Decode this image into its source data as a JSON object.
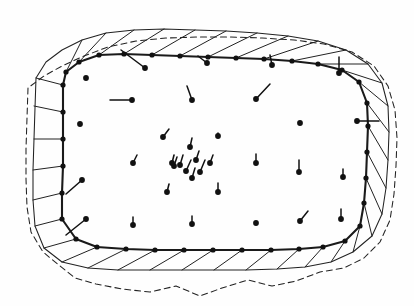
{
  "figure": {
    "kind": "mesh-vector-field",
    "background_color": "#fefefe",
    "ink_color": "#111111",
    "width": 414,
    "height": 306
  },
  "legend": {
    "mesh_boundary_label": "mesh boundary",
    "outer_contour_label": "outer contour",
    "dashed_contour_label": "reference contour",
    "vector_label": "displacement vector"
  },
  "chart_data": {
    "type": "scatter",
    "xlabel": "",
    "ylabel": "",
    "xlim": [
      0,
      414
    ],
    "ylim": [
      0,
      306
    ],
    "grid": false,
    "legend_position": "none",
    "mesh_boundary": [
      [
        63,
        85
      ],
      [
        63,
        112
      ],
      [
        63,
        139
      ],
      [
        63,
        166
      ],
      [
        62,
        193
      ],
      [
        62,
        219
      ],
      [
        76,
        239
      ],
      [
        97,
        247
      ],
      [
        126,
        249
      ],
      [
        155,
        250
      ],
      [
        184,
        250
      ],
      [
        213,
        250
      ],
      [
        242,
        250
      ],
      [
        271,
        250
      ],
      [
        299,
        249
      ],
      [
        323,
        247
      ],
      [
        345,
        241
      ],
      [
        360,
        226
      ],
      [
        364,
        203
      ],
      [
        366,
        178
      ],
      [
        367,
        152
      ],
      [
        368,
        126
      ],
      [
        367,
        103
      ],
      [
        359,
        82
      ],
      [
        342,
        70
      ],
      [
        318,
        64
      ],
      [
        292,
        61
      ],
      [
        264,
        59
      ],
      [
        236,
        58
      ],
      [
        208,
        57
      ],
      [
        180,
        56
      ],
      [
        152,
        55
      ],
      [
        124,
        54
      ],
      [
        99,
        55
      ],
      [
        79,
        62
      ],
      [
        66,
        72
      ]
    ],
    "outer_contour": [
      [
        36,
        78
      ],
      [
        35,
        108
      ],
      [
        34,
        139
      ],
      [
        33,
        170
      ],
      [
        33,
        200
      ],
      [
        35,
        226
      ],
      [
        44,
        248
      ],
      [
        62,
        262
      ],
      [
        88,
        268
      ],
      [
        118,
        270
      ],
      [
        150,
        270
      ],
      [
        182,
        270
      ],
      [
        214,
        270
      ],
      [
        246,
        270
      ],
      [
        277,
        269
      ],
      [
        305,
        267
      ],
      [
        331,
        262
      ],
      [
        353,
        252
      ],
      [
        372,
        236
      ],
      [
        382,
        214
      ],
      [
        386,
        188
      ],
      [
        388,
        160
      ],
      [
        389,
        132
      ],
      [
        388,
        106
      ],
      [
        382,
        83
      ],
      [
        368,
        64
      ],
      [
        346,
        50
      ],
      [
        318,
        41
      ],
      [
        288,
        36
      ],
      [
        257,
        33
      ],
      [
        226,
        31
      ],
      [
        195,
        30
      ],
      [
        164,
        29
      ],
      [
        134,
        30
      ],
      [
        106,
        33
      ],
      [
        82,
        40
      ],
      [
        62,
        50
      ],
      [
        46,
        62
      ]
    ],
    "dashed_contour": [
      [
        28,
        88
      ],
      [
        27,
        118
      ],
      [
        26,
        149
      ],
      [
        26,
        179
      ],
      [
        27,
        207
      ],
      [
        31,
        232
      ],
      [
        43,
        252
      ],
      [
        60,
        266
      ],
      [
        75,
        278
      ],
      [
        96,
        284
      ],
      [
        122,
        289
      ],
      [
        150,
        292
      ],
      [
        176,
        286
      ],
      [
        200,
        296
      ],
      [
        222,
        288
      ],
      [
        248,
        280
      ],
      [
        272,
        286
      ],
      [
        296,
        281
      ],
      [
        320,
        272
      ],
      [
        344,
        268
      ],
      [
        364,
        258
      ],
      [
        380,
        242
      ],
      [
        390,
        220
      ],
      [
        394,
        194
      ],
      [
        396,
        166
      ],
      [
        397,
        138
      ],
      [
        395,
        110
      ],
      [
        388,
        86
      ],
      [
        374,
        66
      ],
      [
        352,
        52
      ],
      [
        324,
        44
      ],
      [
        294,
        40
      ],
      [
        262,
        38
      ],
      [
        230,
        37
      ],
      [
        198,
        37
      ],
      [
        166,
        38
      ],
      [
        136,
        41
      ],
      [
        108,
        47
      ],
      [
        84,
        56
      ],
      [
        62,
        66
      ],
      [
        44,
        76
      ]
    ],
    "rib_segments": [
      [
        [
          63,
          85
        ],
        [
          36,
          78
        ]
      ],
      [
        [
          63,
          112
        ],
        [
          34,
          106
        ]
      ],
      [
        [
          63,
          139
        ],
        [
          34,
          139
        ]
      ],
      [
        [
          63,
          166
        ],
        [
          33,
          170
        ]
      ],
      [
        [
          62,
          193
        ],
        [
          33,
          200
        ]
      ],
      [
        [
          62,
          219
        ],
        [
          35,
          226
        ]
      ],
      [
        [
          76,
          239
        ],
        [
          44,
          248
        ]
      ],
      [
        [
          97,
          247
        ],
        [
          62,
          262
        ]
      ],
      [
        [
          126,
          249
        ],
        [
          88,
          268
        ]
      ],
      [
        [
          155,
          250
        ],
        [
          118,
          270
        ]
      ],
      [
        [
          184,
          250
        ],
        [
          150,
          270
        ]
      ],
      [
        [
          213,
          250
        ],
        [
          182,
          270
        ]
      ],
      [
        [
          242,
          250
        ],
        [
          214,
          270
        ]
      ],
      [
        [
          271,
          250
        ],
        [
          246,
          270
        ]
      ],
      [
        [
          299,
          249
        ],
        [
          277,
          269
        ]
      ],
      [
        [
          323,
          247
        ],
        [
          305,
          267
        ]
      ],
      [
        [
          345,
          241
        ],
        [
          331,
          262
        ]
      ],
      [
        [
          360,
          226
        ],
        [
          353,
          252
        ]
      ],
      [
        [
          364,
          203
        ],
        [
          372,
          236
        ]
      ],
      [
        [
          366,
          178
        ],
        [
          382,
          214
        ]
      ],
      [
        [
          367,
          152
        ],
        [
          386,
          188
        ]
      ],
      [
        [
          368,
          126
        ],
        [
          388,
          160
        ]
      ],
      [
        [
          367,
          103
        ],
        [
          389,
          132
        ]
      ],
      [
        [
          359,
          82
        ],
        [
          388,
          106
        ]
      ],
      [
        [
          342,
          70
        ],
        [
          382,
          83
        ]
      ],
      [
        [
          318,
          64
        ],
        [
          368,
          64
        ]
      ],
      [
        [
          292,
          61
        ],
        [
          346,
          50
        ]
      ],
      [
        [
          264,
          59
        ],
        [
          318,
          41
        ]
      ],
      [
        [
          236,
          58
        ],
        [
          288,
          36
        ]
      ],
      [
        [
          208,
          57
        ],
        [
          257,
          33
        ]
      ],
      [
        [
          180,
          56
        ],
        [
          226,
          31
        ]
      ],
      [
        [
          152,
          55
        ],
        [
          195,
          30
        ]
      ],
      [
        [
          124,
          54
        ],
        [
          164,
          29
        ]
      ],
      [
        [
          99,
          55
        ],
        [
          134,
          30
        ]
      ],
      [
        [
          79,
          62
        ],
        [
          106,
          33
        ]
      ],
      [
        [
          66,
          72
        ],
        [
          82,
          40
        ]
      ]
    ],
    "vectors": [
      {
        "x": 86,
        "y": 78,
        "dx": 0,
        "dy": 0
      },
      {
        "x": 145,
        "y": 68,
        "dx": -24,
        "dy": -18
      },
      {
        "x": 207,
        "y": 63,
        "dx": -9,
        "dy": -7
      },
      {
        "x": 272,
        "y": 65,
        "dx": -2,
        "dy": -10
      },
      {
        "x": 339,
        "y": 73,
        "dx": 0,
        "dy": -16
      },
      {
        "x": 132,
        "y": 100,
        "dx": -22,
        "dy": 0
      },
      {
        "x": 192,
        "y": 100,
        "dx": -5,
        "dy": -14
      },
      {
        "x": 256,
        "y": 99,
        "dx": 14,
        "dy": -15
      },
      {
        "x": 357,
        "y": 121,
        "dx": 22,
        "dy": 0
      },
      {
        "x": 80,
        "y": 124,
        "dx": 0,
        "dy": 0
      },
      {
        "x": 300,
        "y": 123,
        "dx": 0,
        "dy": 0
      },
      {
        "x": 163,
        "y": 137,
        "dx": 6,
        "dy": -8
      },
      {
        "x": 218,
        "y": 136,
        "dx": 0,
        "dy": -3
      },
      {
        "x": 190,
        "y": 147,
        "dx": 2,
        "dy": -9
      },
      {
        "x": 196,
        "y": 160,
        "dx": 3,
        "dy": -9
      },
      {
        "x": 180,
        "y": 165,
        "dx": 3,
        "dy": -10
      },
      {
        "x": 186,
        "y": 171,
        "dx": 5,
        "dy": -11
      },
      {
        "x": 200,
        "y": 172,
        "dx": 5,
        "dy": -12
      },
      {
        "x": 174,
        "y": 166,
        "dx": 3,
        "dy": -9
      },
      {
        "x": 192,
        "y": 178,
        "dx": 3,
        "dy": -10
      },
      {
        "x": 210,
        "y": 163,
        "dx": 3,
        "dy": -8
      },
      {
        "x": 172,
        "y": 163,
        "dx": 2,
        "dy": -8
      },
      {
        "x": 133,
        "y": 163,
        "dx": 4,
        "dy": -8
      },
      {
        "x": 82,
        "y": 180,
        "dx": -16,
        "dy": 14
      },
      {
        "x": 167,
        "y": 192,
        "dx": 2,
        "dy": -8
      },
      {
        "x": 218,
        "y": 192,
        "dx": 0,
        "dy": -9
      },
      {
        "x": 256,
        "y": 163,
        "dx": 0,
        "dy": -9
      },
      {
        "x": 299,
        "y": 172,
        "dx": 0,
        "dy": -12
      },
      {
        "x": 343,
        "y": 177,
        "dx": 0,
        "dy": -8
      },
      {
        "x": 86,
        "y": 219,
        "dx": -20,
        "dy": 16
      },
      {
        "x": 133,
        "y": 225,
        "dx": 0,
        "dy": -8
      },
      {
        "x": 192,
        "y": 224,
        "dx": 0,
        "dy": -8
      },
      {
        "x": 256,
        "y": 223,
        "dx": 0,
        "dy": 0
      },
      {
        "x": 300,
        "y": 221,
        "dx": 8,
        "dy": -10
      },
      {
        "x": 341,
        "y": 219,
        "dx": 0,
        "dy": -10
      }
    ]
  }
}
